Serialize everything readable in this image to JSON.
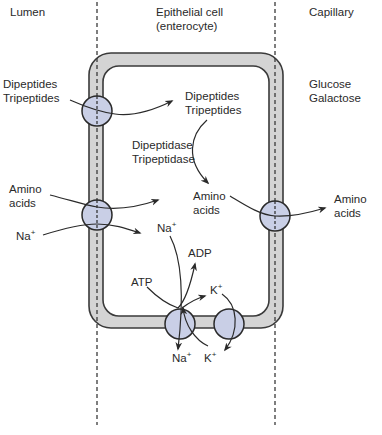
{
  "regions": {
    "lumen": "Lumen",
    "cell_line1": "Epithelial cell",
    "cell_line2": "(enterocyte)",
    "capillary": "Capillary"
  },
  "labels": {
    "lumen_peptides_1": "Dipeptides",
    "lumen_peptides_2": "Tripeptides",
    "cell_peptides_1": "Dipeptides",
    "cell_peptides_2": "Tripeptides",
    "enzyme_1": "Dipeptidase",
    "enzyme_2": "Tripeptidase",
    "glucose": "Glucose",
    "galactose": "Galactose",
    "lumen_amino_1": "Amino",
    "lumen_amino_2": "acids",
    "cell_amino_1": "Amino",
    "cell_amino_2": "acids",
    "cap_amino_1": "Amino",
    "cap_amino_2": "acids",
    "lumen_na": "Na",
    "cell_na": "Na",
    "atp": "ATP",
    "adp": "ADP",
    "cell_k": "K",
    "out_na": "Na",
    "out_k": "K",
    "plus": "+"
  },
  "colors": {
    "membrane_fill": "#d4d4d4",
    "membrane_stroke": "#3a3a3a",
    "transporter_fill": "#c9cfe6",
    "line": "#2a2a2a"
  }
}
